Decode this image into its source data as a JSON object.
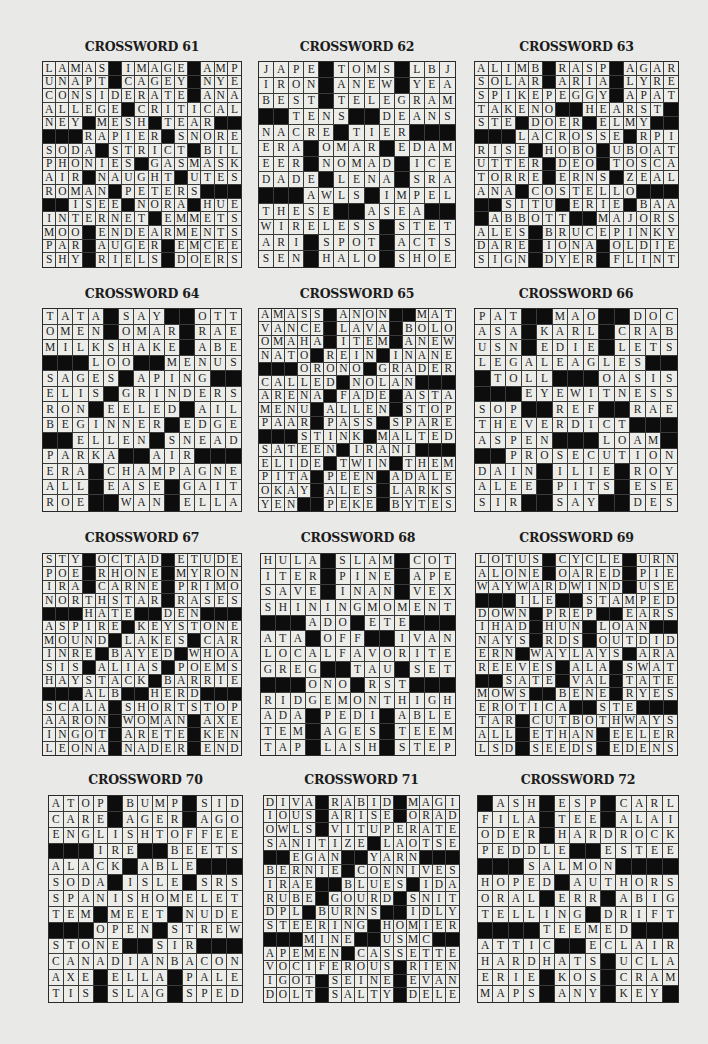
{
  "puzzles": [
    {
      "title": "CROSSWORD 61",
      "size": 15,
      "rows": [
        "LAMAS#IMAGE#AMP",
        "UNAPT#CAGEY#NYE",
        "CONSIDERATE#ANA",
        "ALLEGE#CRITICAL",
        "NEY#MESH#TEAR##",
        "###RAPIER#SNORE",
        "SODA#STRICT#BIL",
        "PHONIES#GASMASK",
        "AIR#NAUGHT#UTES",
        "ROMAN#PETERS###",
        "##ISEE#NORA#HUE",
        "INTERNET#EMMETS",
        "MOO#ENDEARMENTS",
        "PAR#AUGER#EMCEE",
        "SHY#RIELS#DOERS"
      ]
    },
    {
      "title": "CROSSWORD 62",
      "size": 13,
      "rows": [
        "JAPE#TOMS#LBJ",
        "IRON#ANEW#YEA",
        "BEST#TELEGRAM",
        "##TENS##DEANS",
        "NACRE#TIER###",
        "ERA#OMAR#EDAM",
        "EER#NOMAD#ICE",
        "DADE#LENA#SRA",
        "###AWLS#IMPEL",
        "THESE##ASEA##",
        "WIRELESS#STET",
        "ARI#SPOT#ACTS",
        "SEN#HALO#SHOE"
      ]
    },
    {
      "title": "CROSSWORD 63",
      "size": 15,
      "rows": [
        "ALIMB#RASP#AGAR",
        "SOLAR#ARIA#LYRE",
        "SPIKEPEGGY#APAT",
        "TAKENO##HEARST#",
        "STE#DOER#ELMY##",
        "###LACROSSE#RPI",
        "RISE#HOBO#UBOAT",
        "UTTER#DEO#TOSCA",
        "TORRE#ERNS#ZEAL",
        "ANA#COSTELLO###",
        "##SITU#ERIE#BAA",
        "#ABBOTT##MAJORS",
        "ALES#BRUCEPINKY",
        "DARE#IONA#OLDIE",
        "SIGN#DYER#FLINT"
      ]
    },
    {
      "title": "CROSSWORD 64",
      "size": 13,
      "rows": [
        "TATA#SAY##OTT",
        "OMEN#OMAR#RAE",
        "MILKSHAKE#ABE",
        "###LOO##MENUS",
        "SAGES#APING##",
        "ELIS#GRINDERS",
        "RON#EELED#AIL",
        "BEGINNER#EDGE",
        "##ELLEN#SNEAD",
        "PARKA##AIR###",
        "ERA#CHAMPAGNE",
        "ALL#EASE#GAIT",
        "ROE##WAN#ELLA"
      ]
    },
    {
      "title": "CROSSWORD 65",
      "size": 15,
      "rows": [
        "AMASS#ANON##MAT",
        "VANCE#LAVA#BOLO",
        "OMAHA#ITEM#ANEW",
        "NATO#REIN#INANE",
        "###ORONO#GRADER",
        "CALLED#NOLAN###",
        "ARENA#FADE#ASTA",
        "MENU#ALLEN#STOP",
        "PAAR#PASS#SPARE",
        "###STINK#MALTED",
        "SATEEN#IRANI###",
        "ELIDE#TWIN#THEM",
        "PITA#PEEN#ADALE",
        "OKAY#ALES#LARKS",
        "YEN##PEKE#BYTES"
      ]
    },
    {
      "title": "CROSSWORD 66",
      "size": 13,
      "rows": [
        "PAT##MAO##DOC",
        "ASA#KARL#CRAB",
        "USN#EDIE#LETS",
        "LEGALEAGLES##",
        "#TOLL###OASIS",
        "###EYEWITNESS",
        "SOP##REF##RAE",
        "THEVERDICT###",
        "ASPEN###LOAM#",
        "##PROSECUTION",
        "DAIN#ILIE#ROY",
        "ALEE#PITS#ESE",
        "SIR##SAY##DES"
      ]
    },
    {
      "title": "CROSSWORD 67",
      "size": 15,
      "rows": [
        "STY#OCTAD#ETUDE",
        "POE#RHONE#MYRON",
        "IRA#CARNE#PRIMO",
        "NORTHSTAR#RASES",
        "###HATE##DEN###",
        "ASPIRE#KEYSTONE",
        "MOUND#LAKES#CAR",
        "INRE#BAYED#WHOA",
        "SIS#ALIAS#POEMS",
        "HAYSTACK#BARRIE",
        "###ALB##HERD###",
        "SCALA#SHORTSTOP",
        "AARON#WOMAN#AXE",
        "INGOT#ARETE#KEN",
        "LEONA#NADER#END"
      ]
    },
    {
      "title": "CROSSWORD 68",
      "size": 13,
      "rows": [
        "HULA#SLAM#COT",
        "ITER#PINE#APE",
        "SAVE#INAN#VEX",
        "SHININGMOMENT",
        "###ADO#ETE###",
        "ATA#OFF##IVAN",
        "LOCALFAVORITE",
        "GREG##TAU#SET",
        "###ONO#RST###",
        "RIDGEMONTHIGH",
        "ADA#PEDI#ABLE",
        "TEM#AGES#TEEM",
        "TAP#LASH#STEP"
      ]
    },
    {
      "title": "CROSSWORD 69",
      "size": 15,
      "rows": [
        "LOTUS#CYCLE#URN",
        "ALONE#OARED#PIE",
        "WAYWARDWIND#USE",
        "###ILE##STAMPED",
        "DOWN#PREP##EARS",
        "IHAD#HUN#LOAN##",
        "NAYS#RDS#OUTDID",
        "ERN#WAYLAYS#ARA",
        "REEVES#ALA#SWAT",
        "##SATE#VAL#TATE",
        "MOWS##BENE#RYES",
        "EROTICA##STE###",
        "TAR#CUTBOTHWAYS",
        "ALL#ETHAN#EELER",
        "LSD#SEEDS#EDENS"
      ]
    },
    {
      "title": "CROSSWORD 70",
      "size": 13,
      "rows": [
        "ATOP#BUMP#SID",
        "CARE#AGER#AGO",
        "ENGLISHTOFFEE",
        "###IRE##BEETS",
        "ALACK#ABLE###",
        "SODA#ISLE#SRS",
        "SPANISHOMELET",
        "TEM#MEET#NUDE",
        "###OPEN#STREW",
        "STONE##SIR###",
        "CANADIANBACON",
        "AXE#ELLA#PALE",
        "TIS#SLAG#SPED"
      ]
    },
    {
      "title": "CROSSWORD 71",
      "size": 15,
      "rows": [
        "DIVA#RABID#MAGI",
        "IOUS#ARISE#ORAD",
        "OWLS#VITUPERATE",
        "SANITIZE#LAOTSE",
        "##EGAN##YARN###",
        "BERNIE#CONNIVES",
        "IRAE##BLUES#IDA",
        "RUBE#GOURD#SNIT",
        "DPL#BURNS##IDLY",
        "STEERING#HOMIER",
        "###MINE##USMC##",
        "APEMEN#CASSETTE",
        "VOCIFEROUS#RIEN",
        "IGOT#SEINE#EVAN",
        "DOLT#SALTY#DELE"
      ]
    },
    {
      "title": "CROSSWORD 72",
      "size": 13,
      "rows": [
        "#ASH#ESP#CARL",
        "FILA#TEE#ALAI",
        "ODER#HARDROCK",
        "PEDDLE##ESTEE",
        "###SALMON####",
        "HOPED#AUTHORS",
        "ORAL#ERR#ABIG",
        "TELLING#DRIFT",
        "####TEEMED###",
        "ATTIC##ECLAIR",
        "HARDHATS#UCLA",
        "ERIE#KOS#CRAM",
        "MAPS#ANY#KEY#"
      ]
    }
  ],
  "colors": {
    "page_background": "#e9e9e7",
    "cell_background": "#ecece9",
    "block_color": "#0d0d0d",
    "text_color": "#1e1e1e"
  }
}
